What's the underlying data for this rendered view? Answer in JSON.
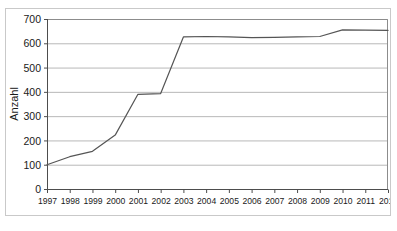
{
  "figure": {
    "caption_top": "",
    "caption_bottom": ""
  },
  "chart_data": {
    "type": "line",
    "title": "",
    "xlabel": "",
    "ylabel": "Anzahl",
    "categories": [
      "1997",
      "1998",
      "1999",
      "2000",
      "2001",
      "2002",
      "2003",
      "2004",
      "2005",
      "2006",
      "2007",
      "2008",
      "2009",
      "2010",
      "2011",
      "2012"
    ],
    "values": [
      100,
      133,
      155,
      222,
      390,
      393,
      626,
      628,
      626,
      623,
      624,
      626,
      628,
      655,
      654,
      653
    ],
    "x": [
      1997,
      1998,
      1999,
      2000,
      2001,
      2002,
      2003,
      2004,
      2005,
      2006,
      2007,
      2008,
      2009,
      2010,
      2011,
      2012
    ],
    "ylim": [
      0,
      700
    ],
    "xlim": [
      1997,
      2012
    ],
    "yticks": [
      0,
      100,
      200,
      300,
      400,
      500,
      600,
      700
    ],
    "ytick_labels": [
      "0",
      "100",
      "200",
      "300",
      "400",
      "500",
      "600",
      "700"
    ],
    "xtick_labels": [
      "1997",
      "1998",
      "1999",
      "2000",
      "2001",
      "2002",
      "2003",
      "2004",
      "2005",
      "2006",
      "2007",
      "2008",
      "2009",
      "2010",
      "2011",
      "2012"
    ],
    "grid": "horizontal",
    "legend": "none",
    "series": [
      {
        "name": "Anzahl",
        "color": "#555555",
        "values": [
          100,
          133,
          155,
          222,
          390,
          393,
          626,
          628,
          626,
          623,
          624,
          626,
          628,
          655,
          654,
          653
        ]
      }
    ],
    "colors": {
      "line": "#555555",
      "grid": "#b8b8b8",
      "axis": "#4d4d4d",
      "frame": "#8c8c8c",
      "background": "#ffffff",
      "figure_border": "#c9c9c9",
      "text": "#1a1a1a"
    }
  }
}
